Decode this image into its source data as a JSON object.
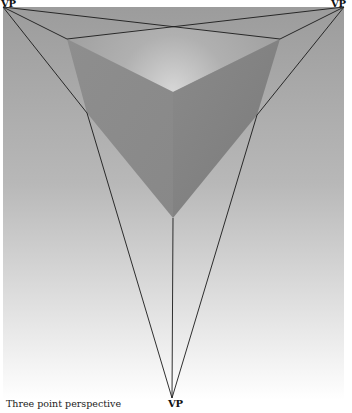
{
  "diagram": {
    "title": "Three point perspective",
    "vanishing_points": [
      {
        "id": "left",
        "label": "VP",
        "x": 3,
        "y": 7
      },
      {
        "id": "right",
        "label": "VP",
        "x": 344,
        "y": 7
      },
      {
        "id": "bottom",
        "label": "VP",
        "x": 172,
        "y": 398
      }
    ],
    "cube": {
      "top_face": [
        [
          170,
          26
        ],
        [
          280,
          39
        ],
        [
          173,
          92
        ],
        [
          67,
          39
        ]
      ],
      "left_face": [
        [
          67,
          39
        ],
        [
          173,
          92
        ],
        [
          173,
          218
        ],
        [
          87,
          113
        ]
      ],
      "right_face": [
        [
          280,
          39
        ],
        [
          257,
          115
        ],
        [
          173,
          218
        ],
        [
          173,
          92
        ]
      ]
    },
    "colors": {
      "background_top": "#9c9c9c",
      "background_bottom": "#ffffff",
      "top_face": "#a8a8a8",
      "top_face_glow": "#d4d4d4",
      "left_face": "#8c8c8c",
      "right_face": "#808080",
      "lines": "#1a1a1a"
    }
  }
}
